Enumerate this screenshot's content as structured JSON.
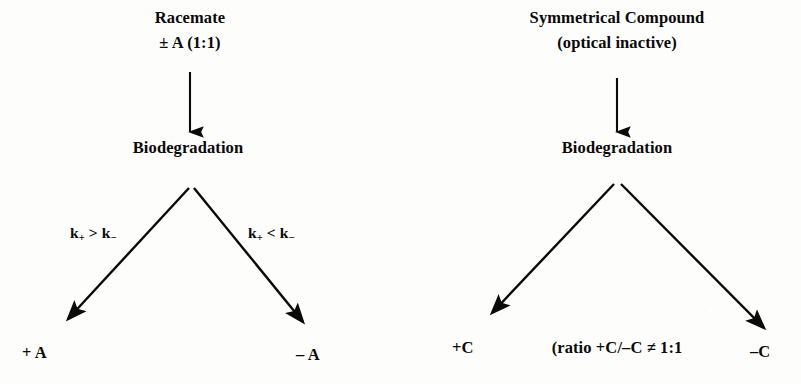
{
  "figure": {
    "background_color": "#fdfdfc",
    "ink_color": "#0a0a0a",
    "panels": [
      {
        "id": "racemate-panel",
        "title_line1": "Racemate",
        "title_line2": "± A (1:1)",
        "process": "Biodegradation",
        "rate_label_left": "k",
        "rate_label_left_full": "k₊ > k₋",
        "rate_label_right_full": "k₊ < k₋",
        "rate_left_sub1": "+",
        "rate_left_operator": ">",
        "rate_left_sub2": "−",
        "rate_right_sub1": "+",
        "rate_right_operator": "<",
        "rate_right_sub2": "−",
        "product_left": "+ A",
        "product_right": "– A"
      },
      {
        "id": "symmetrical-panel",
        "title_line1": "Symmetrical Compound",
        "title_line2": "(optical inactive)",
        "process": "Biodegradation",
        "product_left": "+C",
        "product_right": "–C",
        "ratio_note": "(ratio +C/–C ≠ 1:1"
      }
    ]
  }
}
